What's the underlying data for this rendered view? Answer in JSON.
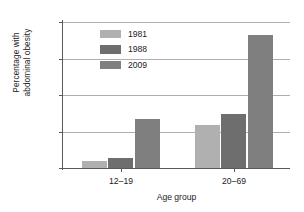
{
  "chart_data": {
    "type": "bar",
    "title": "",
    "xlabel": "Age group",
    "ylabel": "Percentage with abdominal obesity",
    "ylabel_lines": [
      "Percentage with",
      "abdominal obesity"
    ],
    "categories": [
      "12–19",
      "20–69"
    ],
    "series": [
      {
        "name": "1981",
        "values": [
          2.0,
          11.7
        ],
        "color": "#b0b0b0"
      },
      {
        "name": "1988",
        "values": [
          2.8,
          14.7
        ],
        "color": "#6e6e6e"
      },
      {
        "name": "2009",
        "values": [
          13.3,
          36.5
        ],
        "color": "#7f7f7f"
      }
    ],
    "ylim": [
      0,
      40
    ],
    "yticks": [
      0,
      10,
      20,
      30,
      40
    ],
    "ytick_labels": [
      "0",
      "10",
      "20",
      "30",
      "40"
    ],
    "grid": true,
    "legend_position": "upper-left-inside",
    "axis_color": "#5a5a5a",
    "grid_color": "#aeaeae",
    "background": "#ffffff"
  }
}
